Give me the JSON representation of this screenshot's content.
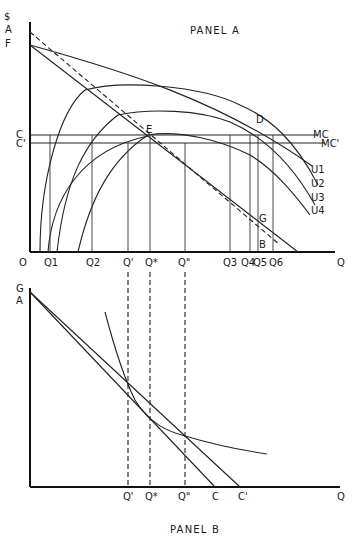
{
  "panel_a": {
    "title": "PANEL A",
    "y_axis_labels": {
      "dollar": "$",
      "a": "A",
      "f": "F",
      "c": "C",
      "c_prime": "C'"
    },
    "origin_label": "O",
    "x_axis_label": "Q",
    "x_ticks": [
      "Q1",
      "Q2",
      "Q'",
      "Q*",
      "Q\"",
      "Q3",
      "Q4",
      "Q5",
      "Q6"
    ],
    "curve_labels": [
      "U1",
      "U2",
      "U3",
      "U4"
    ],
    "line_labels": {
      "mc": "MC",
      "mc_prime": "MC'"
    },
    "point_labels": {
      "d": "D",
      "e": "E",
      "g": "G",
      "b": "B"
    }
  },
  "panel_b": {
    "title": "PANEL B",
    "y_axis_labels": {
      "g": "G",
      "a": "A"
    },
    "x_axis_label": "Q",
    "x_ticks": [
      "Q'",
      "Q*",
      "Q\"",
      "C",
      "C'"
    ]
  }
}
